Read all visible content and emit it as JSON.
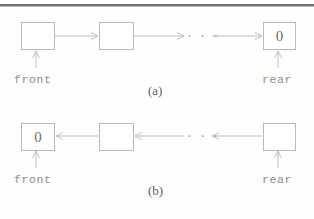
{
  "figure": {
    "background_color": "#fefefe",
    "line_color": "#bcbec0",
    "text_color": "#8a8c8f",
    "panels": [
      {
        "id": "a",
        "caption": "(a)",
        "description": "singly linked list, front at left, rear at right, null terminator 0 in last node",
        "nodes": [
          {
            "id": "a-node-1",
            "value": ""
          },
          {
            "id": "a-node-2",
            "value": ""
          },
          {
            "id": "a-node-last",
            "value": "0"
          }
        ],
        "ellipsis": "· · ·",
        "pointers": [
          {
            "name": "front",
            "label": "front",
            "target": "a-node-1"
          },
          {
            "name": "rear",
            "label": "rear",
            "target": "a-node-last"
          }
        ],
        "arrow_direction": "left-to-right"
      },
      {
        "id": "b",
        "caption": "(b)",
        "description": "singly linked list reversed, front at left holds null terminator 0, rear at right",
        "nodes": [
          {
            "id": "b-node-first",
            "value": "0"
          },
          {
            "id": "b-node-2",
            "value": ""
          },
          {
            "id": "b-node-last",
            "value": ""
          }
        ],
        "ellipsis": "· · ·",
        "pointers": [
          {
            "name": "front",
            "label": "front",
            "target": "b-node-first"
          },
          {
            "name": "rear",
            "label": "rear",
            "target": "b-node-last"
          }
        ],
        "arrow_direction": "right-to-left"
      }
    ]
  }
}
